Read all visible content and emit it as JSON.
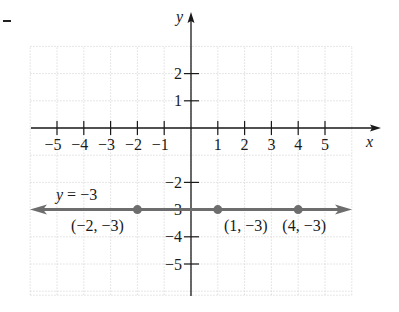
{
  "chart_data": {
    "type": "line",
    "title": "",
    "xlabel": "x",
    "ylabel": "y",
    "xlim": [
      -6,
      6
    ],
    "ylim": [
      -6,
      3
    ],
    "grid": true,
    "x_ticks": [
      -5,
      -4,
      -3,
      -2,
      -1,
      1,
      2,
      3,
      4,
      5
    ],
    "x_tick_labels": [
      "−5",
      "−4",
      "−3",
      "−2",
      "−1",
      "1",
      "2",
      "3",
      "4",
      "5"
    ],
    "y_ticks": [
      2,
      1,
      -2,
      -3,
      -4,
      -5
    ],
    "y_tick_labels": [
      "2",
      "1",
      "−2",
      "−3",
      "−4",
      "−5"
    ],
    "series": [
      {
        "name": "y = −3",
        "equation": "y = −3",
        "type": "horizontal-line",
        "y": -3,
        "arrows": "both",
        "color": "#6d6d6d",
        "points": [
          {
            "x": -2,
            "y": -3,
            "label": "(−2, −3)"
          },
          {
            "x": 1,
            "y": -3,
            "label": "(1, −3)"
          },
          {
            "x": 4,
            "y": -3,
            "label": "(4, −3)"
          }
        ]
      }
    ],
    "annotations": [
      {
        "text": "y = −3",
        "x": -4.2,
        "y": -2.4
      }
    ]
  },
  "page": {
    "corner_mark": "–"
  }
}
